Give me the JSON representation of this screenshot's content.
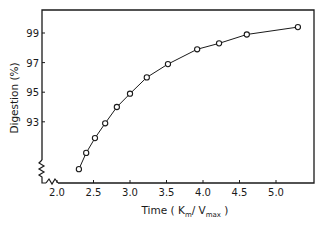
{
  "chart_data": {
    "type": "line",
    "title": "",
    "xlabel": "Time (Km/Vmax)",
    "xlabel_parts": {
      "prefix": "Time ( K",
      "sub1": "m",
      "mid": "/ V",
      "sub2": "max",
      "suffix": " )"
    },
    "ylabel": "Digestion (%)",
    "xlim": [
      1.8,
      5.5
    ],
    "ylim": [
      88.3,
      100.5
    ],
    "x_ticks": [
      2.0,
      2.5,
      3.0,
      3.5,
      4.0,
      4.5,
      5.0
    ],
    "x_tick_labels": [
      "2.0",
      "2.5",
      "3.0",
      "3.5",
      "4.0",
      "4.5",
      "5.0"
    ],
    "y_ticks": [
      93,
      95,
      97,
      99
    ],
    "y_tick_labels": [
      "93",
      "95",
      "97",
      "99"
    ],
    "grid": false,
    "legend": null,
    "axis_breaks": {
      "x": true,
      "y": true
    },
    "marker": "open-circle",
    "series": [
      {
        "name": "Digestion",
        "x": [
          2.3,
          2.4,
          2.52,
          2.66,
          2.82,
          3.0,
          3.23,
          3.52,
          3.92,
          4.22,
          4.6,
          5.3
        ],
        "values": [
          89.8,
          90.9,
          91.9,
          92.9,
          94.0,
          94.9,
          96.0,
          96.9,
          97.9,
          98.3,
          98.9,
          99.4
        ]
      }
    ]
  },
  "colors": {
    "ink": "#1a1a1a",
    "background": "#ffffff"
  }
}
